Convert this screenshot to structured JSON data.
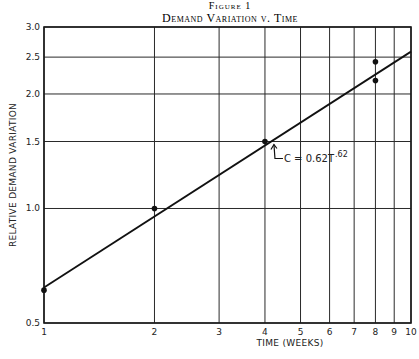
{
  "chart_data": {
    "type": "scatter",
    "figure_label": "Figure 1",
    "title": "Demand Variation v. Time",
    "xlabel": "TIME (WEEKS)",
    "ylabel": "RELATIVE DEMAND VARIATION",
    "xscale": "log",
    "yscale": "log",
    "xlim": [
      1,
      10
    ],
    "ylim": [
      0.5,
      3.0
    ],
    "grid": true,
    "x_ticks": [
      1,
      2,
      3,
      4,
      5,
      6,
      7,
      8,
      9,
      10
    ],
    "x_tick_labels": [
      "1",
      "2",
      "3",
      "4",
      "5",
      "6",
      "7",
      "8",
      "9",
      "10"
    ],
    "y_ticks": [
      0.5,
      1.0,
      1.5,
      2.0,
      2.5,
      3.0
    ],
    "y_tick_labels": [
      "0.5",
      "1.0",
      "1.5",
      "2.0",
      "2.5",
      "3.0"
    ],
    "series": [
      {
        "name": "Observed",
        "kind": "points",
        "x": [
          1,
          2,
          4,
          8,
          8
        ],
        "y": [
          0.61,
          1.0,
          1.5,
          2.17,
          2.43
        ]
      },
      {
        "name": "Fit",
        "kind": "line",
        "equation": {
          "coefficient": 0.62,
          "exponent": 0.62
        },
        "x_range": [
          1,
          10
        ]
      }
    ],
    "annotations": [
      {
        "text": "C = 0.62T",
        "superscript": ".62",
        "points_to": {
          "x": 4,
          "y": 1.5
        }
      }
    ]
  }
}
